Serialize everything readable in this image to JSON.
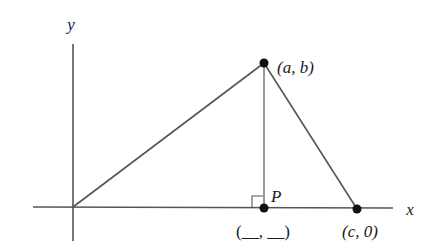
{
  "axes": {
    "x_label": "x",
    "y_label": "y",
    "color": "#555555"
  },
  "points": {
    "apex": {
      "label": "(a, b)"
    },
    "foot": {
      "name": "P",
      "label": "(__, __)"
    },
    "base": {
      "label": "(c, 0)"
    },
    "origin": {
      "label": ""
    }
  },
  "colors": {
    "line": "#555555",
    "dot": "#111111",
    "background": "#ffffff"
  }
}
